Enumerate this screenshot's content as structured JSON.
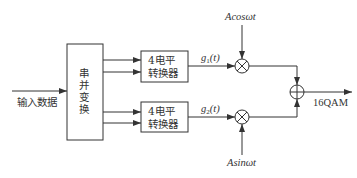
{
  "diagram": {
    "input_label": "输入数据",
    "sp_converter": {
      "chars": [
        "串",
        "并",
        "变",
        "换"
      ]
    },
    "level_converter_1": {
      "line1": "4电平",
      "line2": "转换器"
    },
    "level_converter_2": {
      "line1": "4电平",
      "line2": "转换器"
    },
    "signal_1": {
      "base": "g",
      "sub": "1",
      "arg": "(t)"
    },
    "signal_2": {
      "base": "g",
      "sub": "2",
      "arg": "(t)"
    },
    "carrier_cos": "Acosωt",
    "carrier_sin": "Asinωt",
    "output_label": "16QAM",
    "colors": {
      "stroke": "#333333",
      "background": "#ffffff"
    }
  }
}
